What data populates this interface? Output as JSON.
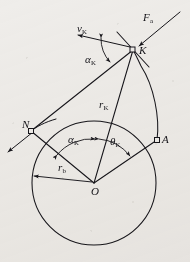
{
  "figure": {
    "kind": "geometry-diagram",
    "background_color": "#efedea",
    "ink_color": "#16151a"
  },
  "points": {
    "O": {
      "label": "O",
      "sub": "",
      "desc": "circle-center",
      "x": 94,
      "y": 183
    },
    "N": {
      "label": "N",
      "sub": "",
      "desc": "tangent-point-on-base-circle",
      "x": 31,
      "y": 131
    },
    "A": {
      "label": "A",
      "sub": "",
      "desc": "involute-start-point",
      "x": 157,
      "y": 140
    },
    "K": {
      "label": "K",
      "sub": "",
      "desc": "point-on-involute",
      "x": 133,
      "y": 50
    }
  },
  "labels": {
    "force": {
      "text": "F",
      "sub": "a",
      "desc": "normal-force-at-K"
    },
    "velocity": {
      "text": "v",
      "sub": "K",
      "desc": "velocity-at-K"
    },
    "alpha_upper": {
      "text": "α",
      "sub": "K",
      "desc": "pressure-angle-at-K"
    },
    "alpha_lower": {
      "text": "α",
      "sub": "K",
      "desc": "pressure-angle-at-center"
    },
    "theta": {
      "text": "θ",
      "sub": "K",
      "desc": "involute-roll-angle"
    },
    "r_K": {
      "text": "r",
      "sub": "K",
      "desc": "radius-to-point-K"
    },
    "r_b": {
      "text": "r",
      "sub": "b",
      "desc": "base-circle-radius"
    },
    "point_O": {
      "text": "O",
      "sub": "",
      "desc": "center-label"
    },
    "point_N": {
      "text": "N",
      "sub": "",
      "desc": "tangent-point-label"
    },
    "point_A": {
      "text": "A",
      "sub": "",
      "desc": "involute-start-label"
    },
    "point_K": {
      "text": "K",
      "sub": "",
      "desc": "involute-point-label"
    }
  },
  "geometry": {
    "base_circle": {
      "cx": 94,
      "cy": 183,
      "r": 62
    },
    "generating_line_NK": {
      "x1": 31,
      "y1": 131,
      "x2": 133,
      "y2": 50
    },
    "generating_line_extension": {
      "x1": 31,
      "y1": 131,
      "x2": 6,
      "y2": 151
    },
    "radius_OK": {
      "x1": 94,
      "y1": 183,
      "x2": 133,
      "y2": 50
    },
    "radius_ON": {
      "x1": 94,
      "y1": 183,
      "x2": 31,
      "y2": 131
    },
    "radius_OA": {
      "x1": 94,
      "y1": 183,
      "x2": 157,
      "y2": 140
    },
    "r_b_arrow": {
      "x1": 94,
      "y1": 183,
      "x2": 33,
      "y2": 176
    },
    "tangent_at_K": {
      "x1": 117,
      "y1": 33,
      "x2": 148,
      "y2": 66
    },
    "force_arrow": {
      "x1": 179,
      "y1": 13,
      "x2": 138,
      "y2": 47
    },
    "velocity_arrow": {
      "x1": 130,
      "y1": 47,
      "x2": 77,
      "y2": 35
    }
  }
}
